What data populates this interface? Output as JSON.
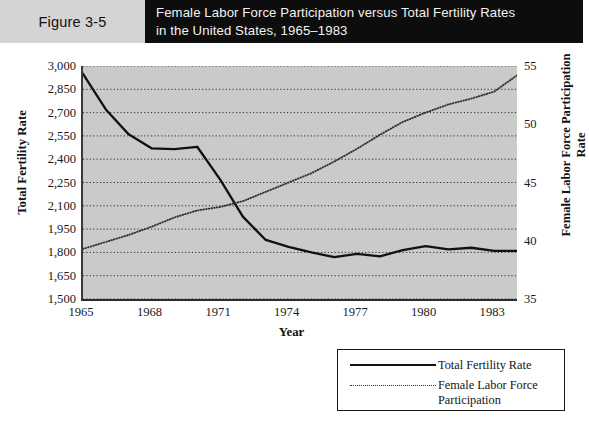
{
  "header": {
    "figure_label": "Figure 3-5",
    "title_line1": "Female Labor Force Participation versus Total Fertility Rates",
    "title_line2": "in the United States, 1965–1983",
    "band_color": "#0d0d0d",
    "label_bg_color": "#d4d4d4"
  },
  "legend": {
    "items": [
      {
        "label": "Total Fertility Rate",
        "style": "solid"
      },
      {
        "label": "Female Labor Force Participation",
        "style": "dotted"
      }
    ]
  },
  "chart_data": {
    "type": "line",
    "title": "Female Labor Force Participation versus Total Fertility Rates in the United States, 1965–1983",
    "xlabel": "Year",
    "ylabel": "Total Fertility Rate",
    "y2label": "Female Labor Force Participation Rate",
    "xlim": [
      1965,
      1984
    ],
    "ylim": [
      1500,
      3000
    ],
    "y2lim": [
      35,
      55
    ],
    "grid": true,
    "grid_style": "dotted-horizontal",
    "legend_position": "below-right",
    "plot_background": "#c9cbc8",
    "xticks": [
      1965,
      1968,
      1971,
      1974,
      1977,
      1980,
      1983
    ],
    "xticklabels": [
      "1965",
      "1968",
      "1971",
      "1974",
      "1977",
      "1980",
      "1983"
    ],
    "yticks": [
      1500,
      1650,
      1800,
      1950,
      2100,
      2250,
      2400,
      2550,
      2700,
      2850,
      3000
    ],
    "yticklabels": [
      "1,500",
      "1,650",
      "1,800",
      "1,950",
      "2,100",
      "2,250",
      "2,400",
      "2,550",
      "2,700",
      "2,850",
      "3,000"
    ],
    "y2ticks": [
      35,
      40,
      45,
      50,
      55
    ],
    "y2ticklabels": [
      "35",
      "40",
      "45",
      "50",
      "55"
    ],
    "y2_gridline_step": 2.5,
    "x": [
      1965,
      1966,
      1967,
      1968,
      1969,
      1970,
      1971,
      1972,
      1973,
      1974,
      1975,
      1976,
      1977,
      1978,
      1979,
      1980,
      1981,
      1982,
      1983,
      1984
    ],
    "series": [
      {
        "name": "Total Fertility Rate",
        "axis": "left",
        "style": "solid",
        "color": "#111111",
        "values": [
          2950,
          2720,
          2560,
          2470,
          2465,
          2480,
          2270,
          2030,
          1880,
          1835,
          1800,
          1770,
          1790,
          1775,
          1815,
          1840,
          1820,
          1830,
          1810,
          1810
        ]
      },
      {
        "name": "Female Labor Force Participation",
        "axis": "right",
        "style": "dotted",
        "color": "#333333",
        "values": [
          39.3,
          39.9,
          40.5,
          41.2,
          42.0,
          42.6,
          42.9,
          43.4,
          44.2,
          45.0,
          45.8,
          46.8,
          47.9,
          49.1,
          50.2,
          51.0,
          51.7,
          52.2,
          52.8,
          54.2
        ]
      }
    ]
  }
}
